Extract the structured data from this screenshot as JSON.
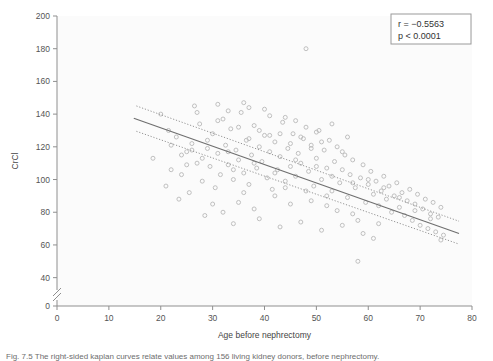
{
  "figure": {
    "caption": "Fig. 7.5   The right-sided kaplan curves relate values among 156 living kidney donors, before nephrectomy."
  },
  "legend_box": {
    "r_label": "r = −0.5563",
    "p_label": "p < 0.0001",
    "border_color": "#9a9a9a"
  },
  "chart_data": {
    "type": "scatter",
    "title": "",
    "xlabel": "Age before nephrectomy",
    "ylabel": "CrCl",
    "xlim": [
      0,
      80
    ],
    "ylim": [
      30,
      200
    ],
    "y_axis_break": true,
    "y_break_between": [
      0,
      40
    ],
    "grid": false,
    "legend_position": "top-right",
    "xticks": [
      0,
      10,
      20,
      30,
      40,
      50,
      60,
      70,
      80
    ],
    "yticks": [
      0,
      40,
      60,
      80,
      100,
      120,
      140,
      160,
      180,
      200
    ],
    "marker": {
      "shape": "open-circle",
      "size": 4,
      "stroke": "#b9b9b9"
    },
    "annotations": [
      {
        "text": "r = −0.5563",
        "x": 72,
        "y": 195
      },
      {
        "text": "p < 0.0001",
        "x": 72,
        "y": 188
      }
    ],
    "series": [
      {
        "name": "Donors",
        "points": [
          [
            18.5,
            113
          ],
          [
            21,
            96
          ],
          [
            21.5,
            130
          ],
          [
            22,
            106
          ],
          [
            23,
            126
          ],
          [
            24,
            103
          ],
          [
            25,
            117
          ],
          [
            25.5,
            92
          ],
          [
            26,
            122
          ],
          [
            27,
            110
          ],
          [
            27.5,
            134
          ],
          [
            28,
            99
          ],
          [
            29,
            119
          ],
          [
            29.5,
            108
          ],
          [
            30,
            128
          ],
          [
            30.5,
            95
          ],
          [
            31,
            116
          ],
          [
            31.5,
            103
          ],
          [
            32,
            137
          ],
          [
            32.5,
            121
          ],
          [
            33,
            109
          ],
          [
            33.5,
            131
          ],
          [
            34,
            100
          ],
          [
            34.5,
            118
          ],
          [
            35,
            112
          ],
          [
            35.5,
            141
          ],
          [
            36,
            104
          ],
          [
            36.5,
            124
          ],
          [
            37,
            97
          ],
          [
            37.5,
            115
          ],
          [
            38,
            133
          ],
          [
            38.5,
            107
          ],
          [
            39,
            120
          ],
          [
            39.5,
            111
          ],
          [
            40,
            127
          ],
          [
            40.5,
            101
          ],
          [
            41,
            117
          ],
          [
            41.5,
            94
          ],
          [
            42,
            123
          ],
          [
            42.5,
            106
          ],
          [
            43,
            114
          ],
          [
            43.5,
            135
          ],
          [
            44,
            99
          ],
          [
            44.5,
            119
          ],
          [
            45,
            108
          ],
          [
            45.5,
            128
          ],
          [
            46,
            102
          ],
          [
            46.5,
            116
          ],
          [
            47,
            110
          ],
          [
            47.5,
            125
          ],
          [
            48,
            180
          ],
          [
            48.5,
            105
          ],
          [
            49,
            121
          ],
          [
            49.5,
            96
          ],
          [
            50,
            113
          ],
          [
            50.5,
            130
          ],
          [
            51,
            100
          ],
          [
            51.5,
            118
          ],
          [
            52,
            107
          ],
          [
            52.5,
            124
          ],
          [
            53,
            93
          ],
          [
            53.5,
            111
          ],
          [
            54,
            120
          ],
          [
            54.5,
            98
          ],
          [
            55,
            106
          ],
          [
            55.5,
            115
          ],
          [
            56,
            89
          ],
          [
            56.5,
            103
          ],
          [
            57,
            112
          ],
          [
            57.5,
            95
          ],
          [
            58,
            50
          ],
          [
            58.5,
            101
          ],
          [
            59,
            109
          ],
          [
            59.5,
            86
          ],
          [
            60,
            97
          ],
          [
            60.5,
            105
          ],
          [
            61,
            91
          ],
          [
            61.5,
            99
          ],
          [
            62,
            84
          ],
          [
            62.5,
            93
          ],
          [
            63,
            102
          ],
          [
            63.5,
            88
          ],
          [
            64,
            96
          ],
          [
            64.5,
            80
          ],
          [
            65,
            90
          ],
          [
            65.5,
            98
          ],
          [
            66,
            83
          ],
          [
            66.5,
            92
          ],
          [
            67,
            78
          ],
          [
            67.5,
            87
          ],
          [
            68,
            94
          ],
          [
            68.5,
            75
          ],
          [
            69,
            85
          ],
          [
            69.5,
            91
          ],
          [
            70,
            72
          ],
          [
            70.5,
            82
          ],
          [
            71,
            88
          ],
          [
            71.5,
            70
          ],
          [
            72,
            79
          ],
          [
            72.5,
            86
          ],
          [
            73,
            68
          ],
          [
            73.5,
            77
          ],
          [
            74,
            83
          ],
          [
            74.5,
            66
          ],
          [
            20,
            140
          ],
          [
            23.5,
            88
          ],
          [
            26.5,
            145
          ],
          [
            28.5,
            78
          ],
          [
            31,
            146
          ],
          [
            33,
            142
          ],
          [
            35,
            86
          ],
          [
            36,
            147
          ],
          [
            37,
            144
          ],
          [
            38,
            82
          ],
          [
            40,
            143
          ],
          [
            41,
            139
          ],
          [
            42,
            90
          ],
          [
            44,
            138
          ],
          [
            45,
            85
          ],
          [
            46,
            136
          ],
          [
            48,
            132
          ],
          [
            49,
            87
          ],
          [
            50,
            129
          ],
          [
            52,
            84
          ],
          [
            53,
            134
          ],
          [
            54,
            81
          ],
          [
            56,
            126
          ],
          [
            57,
            79
          ],
          [
            34,
            73
          ],
          [
            39,
            76
          ],
          [
            43,
            71
          ],
          [
            47,
            74
          ],
          [
            51,
            69
          ],
          [
            55,
            72
          ],
          [
            59,
            67
          ],
          [
            61,
            64
          ],
          [
            30,
            85
          ],
          [
            32,
            80
          ],
          [
            36,
            92
          ],
          [
            44,
            95
          ],
          [
            48,
            93
          ],
          [
            52,
            90
          ],
          [
            58,
            75
          ],
          [
            62,
            73
          ],
          [
            24,
            115
          ],
          [
            26,
            118
          ],
          [
            29,
            124
          ],
          [
            33,
            117
          ],
          [
            37,
            125
          ],
          [
            41,
            127
          ],
          [
            45,
            122
          ],
          [
            49,
            119
          ],
          [
            27,
            141
          ],
          [
            31,
            136
          ],
          [
            35,
            132
          ],
          [
            39,
            130
          ],
          [
            43,
            128
          ],
          [
            47,
            126
          ],
          [
            51,
            123
          ],
          [
            55,
            117
          ],
          [
            22,
            121
          ],
          [
            25,
            109
          ],
          [
            28,
            113
          ],
          [
            34,
            106
          ],
          [
            38,
            110
          ],
          [
            42,
            104
          ],
          [
            46,
            112
          ],
          [
            50,
            108
          ],
          [
            53,
            102
          ],
          [
            57,
            98
          ],
          [
            60,
            100
          ],
          [
            63,
            95
          ],
          [
            66,
            89
          ],
          [
            69,
            81
          ],
          [
            72,
            76
          ],
          [
            74,
            63
          ]
        ]
      }
    ],
    "fit_line": {
      "name": "regression",
      "style": "solid",
      "x_start": 14.8,
      "x_end": 77.5,
      "y_start": 137.5,
      "y_end": 67.0
    },
    "confidence_bands": [
      {
        "name": "upper",
        "style": "dotted",
        "x_start": 15.3,
        "x_end": 77.5,
        "y_start": 145.0,
        "y_end": 74.5
      },
      {
        "name": "lower",
        "style": "dotted",
        "x_start": 15.3,
        "x_end": 77.5,
        "y_start": 129.5,
        "y_end": 60.5
      }
    ]
  }
}
